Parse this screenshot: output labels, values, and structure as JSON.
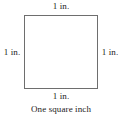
{
  "figure": {
    "kind": "geometry-diagram",
    "shape": "square",
    "caption": "One square inch",
    "background_color": "#ffffff",
    "border_color": "#6e6e6e",
    "text_color": "#1a1a1a",
    "side_labels": {
      "top": "1 in.",
      "right": "1 in.",
      "bottom": "1 in.",
      "left": "1 in."
    }
  }
}
